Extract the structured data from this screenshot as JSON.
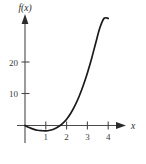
{
  "figure": {
    "background_color": "#ffffff",
    "axis_color": "#4a4a4a",
    "curve_color": "#1a1a1a",
    "text_color": "#3a3a3a",
    "y_axis_title": "f(x)",
    "x_axis_title": "x"
  },
  "chart_data": {
    "type": "line",
    "title": "",
    "xlabel": "x",
    "ylabel": "f(x)",
    "xlim": [
      -0.35,
      4.6
    ],
    "ylim": [
      -5,
      34
    ],
    "grid": false,
    "legend": null,
    "x_ticks": [
      1,
      2,
      3,
      4
    ],
    "x_tick_labels": [
      "1",
      "2",
      "3",
      "4"
    ],
    "y_ticks": [
      10,
      20
    ],
    "y_tick_labels": [
      "10",
      "20"
    ],
    "series": [
      {
        "name": "f(x)",
        "x": [
          0.0,
          0.2,
          0.4,
          0.6,
          0.8,
          1.0,
          1.2,
          1.4,
          1.6,
          1.8,
          2.0,
          2.2,
          2.4,
          2.6,
          2.8,
          3.0,
          3.2,
          3.4,
          3.6,
          3.8,
          4.0
        ],
        "y": [
          0.0,
          -0.65,
          -1.15,
          -1.5,
          -1.65,
          -1.7,
          -1.5,
          -1.1,
          -0.4,
          0.6,
          2.0,
          3.9,
          6.3,
          9.2,
          12.7,
          16.7,
          21.2,
          26.2,
          31.0,
          34.0,
          34.0
        ]
      }
    ],
    "annotations": [
      {
        "text": "local minimum near x = 1",
        "x": 1,
        "y": -1.7
      },
      {
        "text": "x-intercept near x = 2",
        "x": 2,
        "y": 0
      }
    ]
  }
}
